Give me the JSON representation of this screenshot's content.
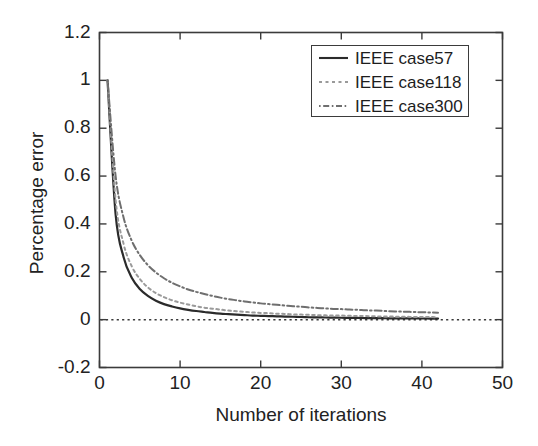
{
  "chart_data": {
    "type": "line",
    "title": "",
    "xlabel": "Number of iterations",
    "ylabel": "Percentage error",
    "xlim": [
      0,
      50
    ],
    "ylim": [
      -0.2,
      1.2
    ],
    "xticks": [
      "0",
      "10",
      "20",
      "30",
      "40",
      "50"
    ],
    "xtick_values": [
      0,
      10,
      20,
      30,
      40,
      50
    ],
    "yticks": [
      "-0.2",
      "0",
      "0.2",
      "0.4",
      "0.6",
      "0.8",
      "1",
      "1.2"
    ],
    "ytick_values": [
      -0.2,
      0,
      0.2,
      0.4,
      0.6,
      0.8,
      1,
      1.2
    ],
    "grid": false,
    "legend_position": "top-right",
    "reference_line": {
      "name": "zero-line",
      "y": 0,
      "style": "dotted",
      "color": "#3a3a3a"
    },
    "x": [
      1,
      2,
      3,
      4,
      5,
      6,
      7,
      8,
      9,
      10,
      11,
      12,
      13,
      14,
      15,
      16,
      17,
      18,
      19,
      20,
      21,
      22,
      23,
      24,
      25,
      26,
      27,
      28,
      29,
      30,
      31,
      32,
      33,
      34,
      35,
      36,
      37,
      38,
      39,
      40,
      41,
      42
    ],
    "series": [
      {
        "name": "IEEE case57",
        "label": "IEEE case57",
        "style": "solid",
        "color": "#2b2b2b",
        "values": [
          1.0,
          0.44,
          0.26,
          0.175,
          0.128,
          0.099,
          0.079,
          0.065,
          0.055,
          0.047,
          0.041,
          0.036,
          0.032,
          0.028,
          0.025,
          0.023,
          0.021,
          0.019,
          0.017,
          0.016,
          0.015,
          0.014,
          0.013,
          0.012,
          0.011,
          0.01,
          0.0095,
          0.0089,
          0.0084,
          0.0079,
          0.0075,
          0.0071,
          0.0067,
          0.0064,
          0.006,
          0.0057,
          0.0055,
          0.0052,
          0.005,
          0.0048,
          0.0046,
          0.0044
        ]
      },
      {
        "name": "IEEE case118",
        "label": "IEEE case118",
        "style": "dotted",
        "color": "#9a9a9a",
        "values": [
          1.0,
          0.5,
          0.315,
          0.223,
          0.17,
          0.135,
          0.111,
          0.094,
          0.081,
          0.071,
          0.063,
          0.056,
          0.05,
          0.046,
          0.042,
          0.038,
          0.035,
          0.033,
          0.03,
          0.028,
          0.027,
          0.025,
          0.024,
          0.022,
          0.021,
          0.02,
          0.019,
          0.018,
          0.017,
          0.017,
          0.016,
          0.015,
          0.015,
          0.014,
          0.013,
          0.013,
          0.012,
          0.012,
          0.011,
          0.011,
          0.011,
          0.01
        ]
      },
      {
        "name": "IEEE case300",
        "label": "IEEE case300",
        "style": "dashdot",
        "color": "#6f6f6f",
        "values": [
          1.0,
          0.6,
          0.425,
          0.33,
          0.27,
          0.228,
          0.197,
          0.173,
          0.154,
          0.139,
          0.126,
          0.116,
          0.107,
          0.099,
          0.092,
          0.086,
          0.081,
          0.076,
          0.072,
          0.068,
          0.065,
          0.062,
          0.059,
          0.056,
          0.054,
          0.051,
          0.049,
          0.047,
          0.045,
          0.044,
          0.042,
          0.041,
          0.039,
          0.038,
          0.037,
          0.035,
          0.034,
          0.033,
          0.032,
          0.031,
          0.03,
          0.029
        ]
      }
    ]
  },
  "axes": {
    "ylabel": "Percentage error",
    "xlabel": "Number of iterations"
  },
  "legend": {
    "entries": [
      {
        "label": "IEEE case57"
      },
      {
        "label": "IEEE case118"
      },
      {
        "label": "IEEE case300"
      }
    ]
  }
}
